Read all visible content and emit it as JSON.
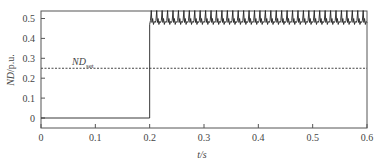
{
  "chart_data": {
    "type": "line",
    "title": "",
    "xlabel": "t/s",
    "ylabel": "ND/p.u.",
    "xlim": [
      0,
      0.6
    ],
    "ylim": [
      -0.05,
      0.55
    ],
    "xticks": [
      "0",
      "0.1",
      "0.2",
      "0.3",
      "0.4",
      "0.5",
      "0.6"
    ],
    "yticks": [
      "0",
      "0.1",
      "0.2",
      "0.3",
      "0.4",
      "0.5"
    ],
    "grid": false,
    "legend": null,
    "annotations": [
      {
        "text": "ND",
        "subscript": "set",
        "x": 0.05,
        "y": 0.28
      }
    ],
    "series": [
      {
        "name": "ND",
        "style": "solid",
        "description": "0 for t<0.2 s, steps to ~0.49 at t=0.2 s then oscillates between ~0.47 and ~0.54",
        "x": [
          0,
          0.2,
          0.2,
          0.6
        ],
        "values": [
          0,
          0,
          0.49,
          0.49
        ],
        "oscillation": {
          "min": 0.47,
          "max": 0.54,
          "cycles": 40
        }
      },
      {
        "name": "ND_set",
        "style": "dashed",
        "x": [
          0,
          0.6
        ],
        "values": [
          0.25,
          0.25
        ]
      }
    ]
  },
  "axes": {
    "xlabel": "t/s",
    "ylabel_main": "ND",
    "ylabel_unit": "/p.u.",
    "annotation_main": "ND",
    "annotation_sub": "set"
  }
}
